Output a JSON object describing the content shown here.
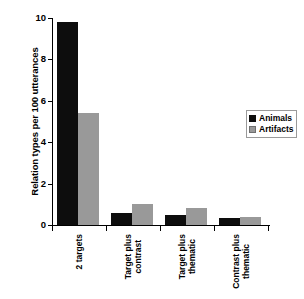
{
  "chart_data": {
    "type": "bar",
    "title": "",
    "xlabel": "",
    "ylabel": "Relation types per 100 utterances",
    "ylim": [
      0,
      10
    ],
    "yticks": [
      0,
      2,
      4,
      6,
      8,
      10
    ],
    "ytick_labels": [
      "0",
      "2",
      "4",
      "6",
      "8",
      "10"
    ],
    "grid": false,
    "legend_position": "upper right",
    "categories": [
      "2 targets",
      "Target plus contrast",
      "Target plus thematic",
      "Contrast plus thematic"
    ],
    "category_lines": [
      [
        "2 targets"
      ],
      [
        "Target plus",
        "contrast"
      ],
      [
        "Target plus",
        "thematic"
      ],
      [
        "Contrast plus",
        "thematic"
      ]
    ],
    "series": [
      {
        "name": "Animals",
        "color": "#0d0d0d",
        "values": [
          9.8,
          0.6,
          0.5,
          0.35
        ]
      },
      {
        "name": "Artifacts",
        "color": "#999999",
        "values": [
          5.4,
          1.0,
          0.8,
          0.4
        ]
      }
    ]
  },
  "legend": {
    "items": [
      {
        "label": "Animals",
        "swatch": "animals-swatch"
      },
      {
        "label": "Artifacts",
        "swatch": "artifacts-swatch"
      }
    ]
  }
}
